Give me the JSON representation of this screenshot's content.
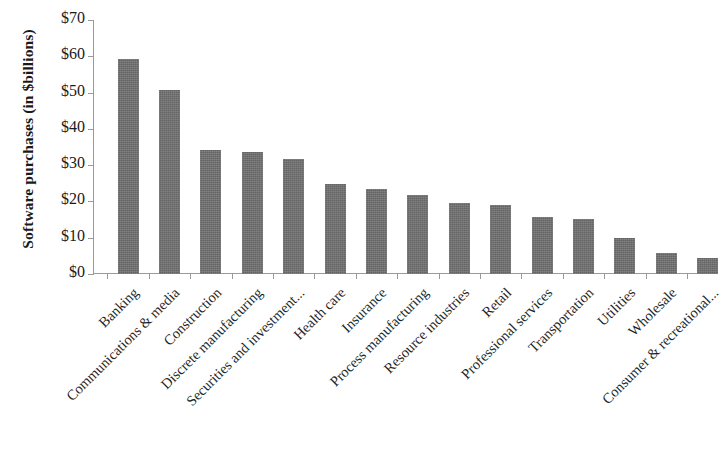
{
  "chart_data": {
    "type": "bar",
    "title": "",
    "subtitle": "",
    "xlabel": "",
    "ylabel": "Software purchases (in $billions)",
    "ylim": [
      0,
      70
    ],
    "ytick_step": 10,
    "ytick_labels": [
      "$0",
      "$10",
      "$20",
      "$30",
      "$40",
      "$50",
      "$60",
      "$70"
    ],
    "ytick_values": [
      0,
      10,
      20,
      30,
      40,
      50,
      60,
      70
    ],
    "grid": false,
    "legend": null,
    "bar_color": "#6e6e6e",
    "axis_color": "#9a9a9a",
    "categories": [
      "Banking",
      "Communications & media",
      "Construction",
      "Discrete manufacturing",
      "Securities and investment...",
      "Health care",
      "Insurance",
      "Process manufacturing",
      "Resource industries",
      "Retail",
      "Professional services",
      "Transportation",
      "Utilities",
      "Wholesale",
      "Consumer & recreational..."
    ],
    "values": [
      59.2,
      50.8,
      34.2,
      33.6,
      31.6,
      24.8,
      23.4,
      21.7,
      19.7,
      19.0,
      15.6,
      15.1,
      9.8,
      5.8,
      4.3
    ]
  }
}
